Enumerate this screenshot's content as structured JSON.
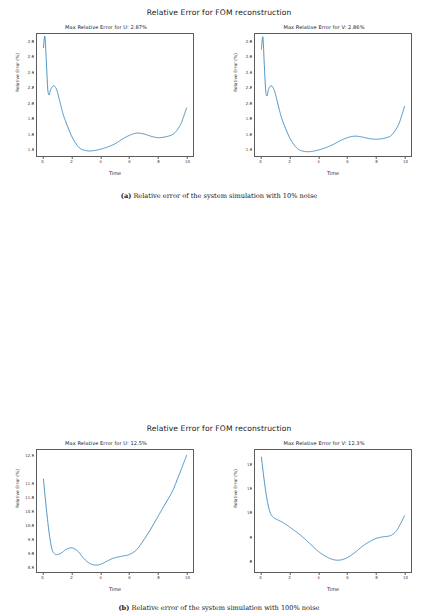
{
  "figures": [
    {
      "title": "Relative Error for FOM reconstruction",
      "caption_label": "(a)",
      "caption_text": "Relative error of the system simulation with 10% noise",
      "panels": [
        {
          "title": "Max Relative Error for U: 2.87%",
          "xlabel": "Time",
          "ylabel": "Relative Error (%)",
          "xticks": [
            "0",
            "2",
            "4",
            "6",
            "8",
            "10"
          ],
          "yticks": [
            "1.4",
            "1.6",
            "1.8",
            "2.0",
            "2.2",
            "2.4",
            "2.6",
            "2.8"
          ]
        },
        {
          "title": "Max Relative Error for V: 2.86%",
          "xlabel": "Time",
          "ylabel": "Relative Error (%)",
          "xticks": [
            "0",
            "2",
            "4",
            "6",
            "8",
            "10"
          ],
          "yticks": [
            "1.4",
            "1.6",
            "1.8",
            "2.0",
            "2.2",
            "2.4",
            "2.6",
            "2.8"
          ]
        }
      ]
    },
    {
      "title": "Relative Error for FOM reconstruction",
      "caption_label": "(b)",
      "caption_text": "Relative error of the system simulation with 100% noise",
      "panels": [
        {
          "title": "Max Relative Error for U: 12.5%",
          "xlabel": "Time",
          "ylabel": "Relative Error (%)",
          "xticks": [
            "0",
            "2",
            "4",
            "6",
            "8",
            "10"
          ],
          "yticks": [
            "8.5",
            "9.0",
            "9.5",
            "10.0",
            "10.5",
            "11.0",
            "11.5",
            "12.5"
          ]
        },
        {
          "title": "Max Relative Error for V: 12.3%",
          "xlabel": "Time",
          "ylabel": "Relative Error (%)",
          "xticks": [
            "0",
            "2",
            "4",
            "6",
            "8",
            "10"
          ],
          "yticks": [
            "8",
            "9",
            "10",
            "11",
            "12"
          ]
        }
      ]
    }
  ],
  "chart_data": [
    {
      "type": "line",
      "title": "Max Relative Error for U: 2.87%",
      "figure_title": "Relative Error for FOM reconstruction",
      "subfigure": "(a) Relative error of the system simulation with 10% noise",
      "xlabel": "Time",
      "ylabel": "Relative Error (%)",
      "xlim": [
        -0.45,
        10.45
      ],
      "ylim": [
        1.3,
        2.9
      ],
      "grid": false,
      "legend": "none",
      "color": "#1f77b4",
      "max_relative_error": 2.87,
      "x": [
        0.0,
        0.1,
        0.2,
        0.3,
        0.4,
        0.5,
        0.7,
        0.9,
        1.1,
        1.3,
        1.5,
        2.0,
        2.5,
        3.0,
        3.5,
        4.0,
        4.5,
        5.0,
        5.5,
        6.0,
        6.5,
        7.0,
        7.5,
        8.0,
        8.5,
        9.0,
        9.3,
        9.6,
        9.8,
        10.0
      ],
      "y": [
        2.72,
        2.87,
        2.55,
        2.18,
        2.1,
        2.17,
        2.22,
        2.18,
        2.05,
        1.9,
        1.78,
        1.55,
        1.41,
        1.37,
        1.37,
        1.39,
        1.42,
        1.46,
        1.52,
        1.57,
        1.6,
        1.59,
        1.56,
        1.54,
        1.55,
        1.58,
        1.63,
        1.72,
        1.82,
        1.93
      ]
    },
    {
      "type": "line",
      "title": "Max Relative Error for V: 2.86%",
      "figure_title": "Relative Error for FOM reconstruction",
      "subfigure": "(a) Relative error of the system simulation with 10% noise",
      "xlabel": "Time",
      "ylabel": "Relative Error (%)",
      "xlim": [
        -0.45,
        10.45
      ],
      "ylim": [
        1.3,
        2.9
      ],
      "grid": false,
      "legend": "none",
      "color": "#1f77b4",
      "max_relative_error": 2.86,
      "x": [
        0.0,
        0.1,
        0.2,
        0.3,
        0.4,
        0.5,
        0.7,
        0.9,
        1.1,
        1.3,
        1.5,
        2.0,
        2.5,
        3.0,
        3.5,
        4.0,
        4.5,
        5.0,
        5.5,
        6.0,
        6.5,
        7.0,
        7.5,
        8.0,
        8.5,
        9.0,
        9.3,
        9.6,
        9.8,
        10.0
      ],
      "y": [
        2.7,
        2.86,
        2.5,
        2.15,
        2.09,
        2.18,
        2.22,
        2.16,
        2.02,
        1.87,
        1.75,
        1.53,
        1.4,
        1.36,
        1.36,
        1.38,
        1.41,
        1.45,
        1.5,
        1.54,
        1.56,
        1.55,
        1.53,
        1.52,
        1.53,
        1.56,
        1.62,
        1.72,
        1.83,
        1.95
      ]
    },
    {
      "type": "line",
      "title": "Max Relative Error for U: 12.5%",
      "figure_title": "Relative Error for FOM reconstruction",
      "subfigure": "(b) Relative error of the system simulation with 100% noise",
      "xlabel": "Time",
      "ylabel": "Relative Error (%)",
      "xlim": [
        -0.45,
        10.45
      ],
      "ylim": [
        8.3,
        12.7
      ],
      "grid": false,
      "legend": "none",
      "color": "#1f77b4",
      "max_relative_error": 12.5,
      "x": [
        0.0,
        0.2,
        0.4,
        0.6,
        0.8,
        1.0,
        1.3,
        1.6,
        2.0,
        2.4,
        2.8,
        3.2,
        3.6,
        4.0,
        4.4,
        4.8,
        5.2,
        5.6,
        6.0,
        6.5,
        7.0,
        7.5,
        8.0,
        8.5,
        9.0,
        9.4,
        9.7,
        10.0
      ],
      "y": [
        11.65,
        10.6,
        9.7,
        9.12,
        8.95,
        8.93,
        9.0,
        9.12,
        9.17,
        9.05,
        8.8,
        8.62,
        8.55,
        8.58,
        8.68,
        8.78,
        8.84,
        8.88,
        8.93,
        9.1,
        9.45,
        9.85,
        10.3,
        10.75,
        11.2,
        11.7,
        12.1,
        12.5
      ]
    },
    {
      "type": "line",
      "title": "Max Relative Error for V: 12.3%",
      "figure_title": "Relative Error for FOM reconstruction",
      "subfigure": "(b) Relative error of the system simulation with 100% noise",
      "xlabel": "Time",
      "ylabel": "Relative Error (%)",
      "xlim": [
        -0.45,
        10.45
      ],
      "ylim": [
        7.5,
        12.6
      ],
      "grid": false,
      "legend": "none",
      "color": "#1f77b4",
      "max_relative_error": 12.3,
      "x": [
        0.0,
        0.2,
        0.4,
        0.6,
        0.8,
        1.0,
        1.4,
        1.8,
        2.2,
        2.6,
        3.0,
        3.5,
        4.0,
        4.5,
        5.0,
        5.5,
        6.0,
        6.5,
        7.0,
        7.5,
        8.0,
        8.5,
        9.0,
        9.4,
        9.7,
        10.0
      ],
      "y": [
        12.3,
        11.3,
        10.5,
        10.0,
        9.8,
        9.72,
        9.6,
        9.45,
        9.28,
        9.1,
        8.9,
        8.62,
        8.35,
        8.15,
        8.02,
        8.0,
        8.1,
        8.3,
        8.55,
        8.75,
        8.9,
        8.97,
        9.02,
        9.2,
        9.5,
        9.85
      ]
    }
  ]
}
